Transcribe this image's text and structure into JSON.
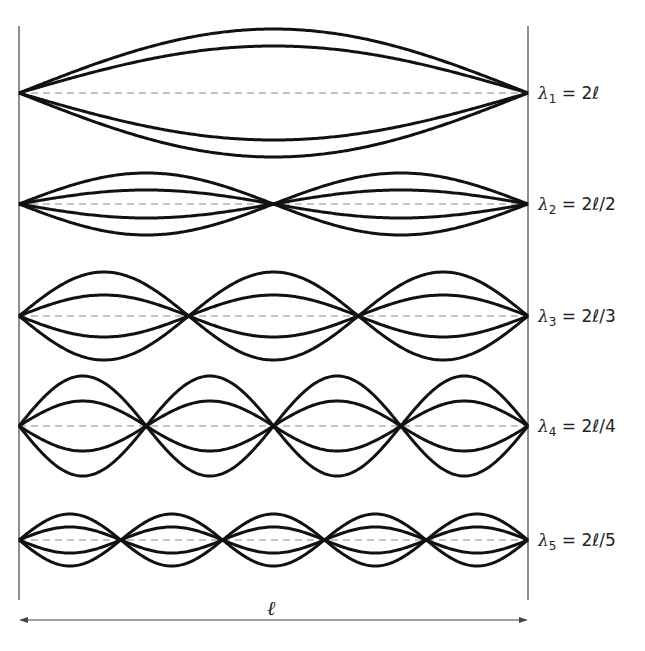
{
  "diagram": {
    "length_label": "ℓ",
    "colors": {
      "wave": "#111111",
      "axis": "#888888",
      "frame": "#444444"
    },
    "frame": {
      "left_x": 19,
      "right_x": 528,
      "top_y": 26,
      "bottom_y": 600,
      "dimension_y": 620
    },
    "modes": [
      {
        "n": 1,
        "symbol": "λ",
        "subscript": "1",
        "formula": "= 2ℓ",
        "center_y": 93,
        "amp_outer": 64,
        "amp_inner": 47
      },
      {
        "n": 2,
        "symbol": "λ",
        "subscript": "2",
        "formula": "= 2ℓ/2",
        "center_y": 204,
        "amp_outer": 31,
        "amp_inner": 14
      },
      {
        "n": 3,
        "symbol": "λ",
        "subscript": "3",
        "formula": "= 2ℓ/3",
        "center_y": 316,
        "amp_outer": 44,
        "amp_inner": 21
      },
      {
        "n": 4,
        "symbol": "λ",
        "subscript": "4",
        "formula": "= 2ℓ/4",
        "center_y": 426,
        "amp_outer": 50,
        "amp_inner": 25
      },
      {
        "n": 5,
        "symbol": "λ",
        "subscript": "5",
        "formula": "= 2ℓ/5",
        "center_y": 540,
        "amp_outer": 26,
        "amp_inner": 13
      }
    ]
  }
}
